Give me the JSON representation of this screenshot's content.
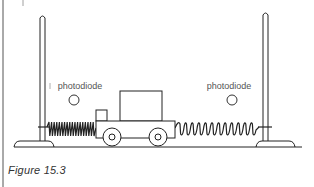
{
  "figure": {
    "caption": "Figure 15.3",
    "labels": {
      "left_sensor": "photodiode",
      "right_sensor": "photodiode"
    },
    "components": [
      "left-stand",
      "right-stand",
      "left-spring",
      "right-spring",
      "trolley",
      "left-photodiode",
      "right-photodiode",
      "track"
    ],
    "colors": {
      "line": "#222222",
      "label": "#555555",
      "background": "#ffffff"
    }
  }
}
